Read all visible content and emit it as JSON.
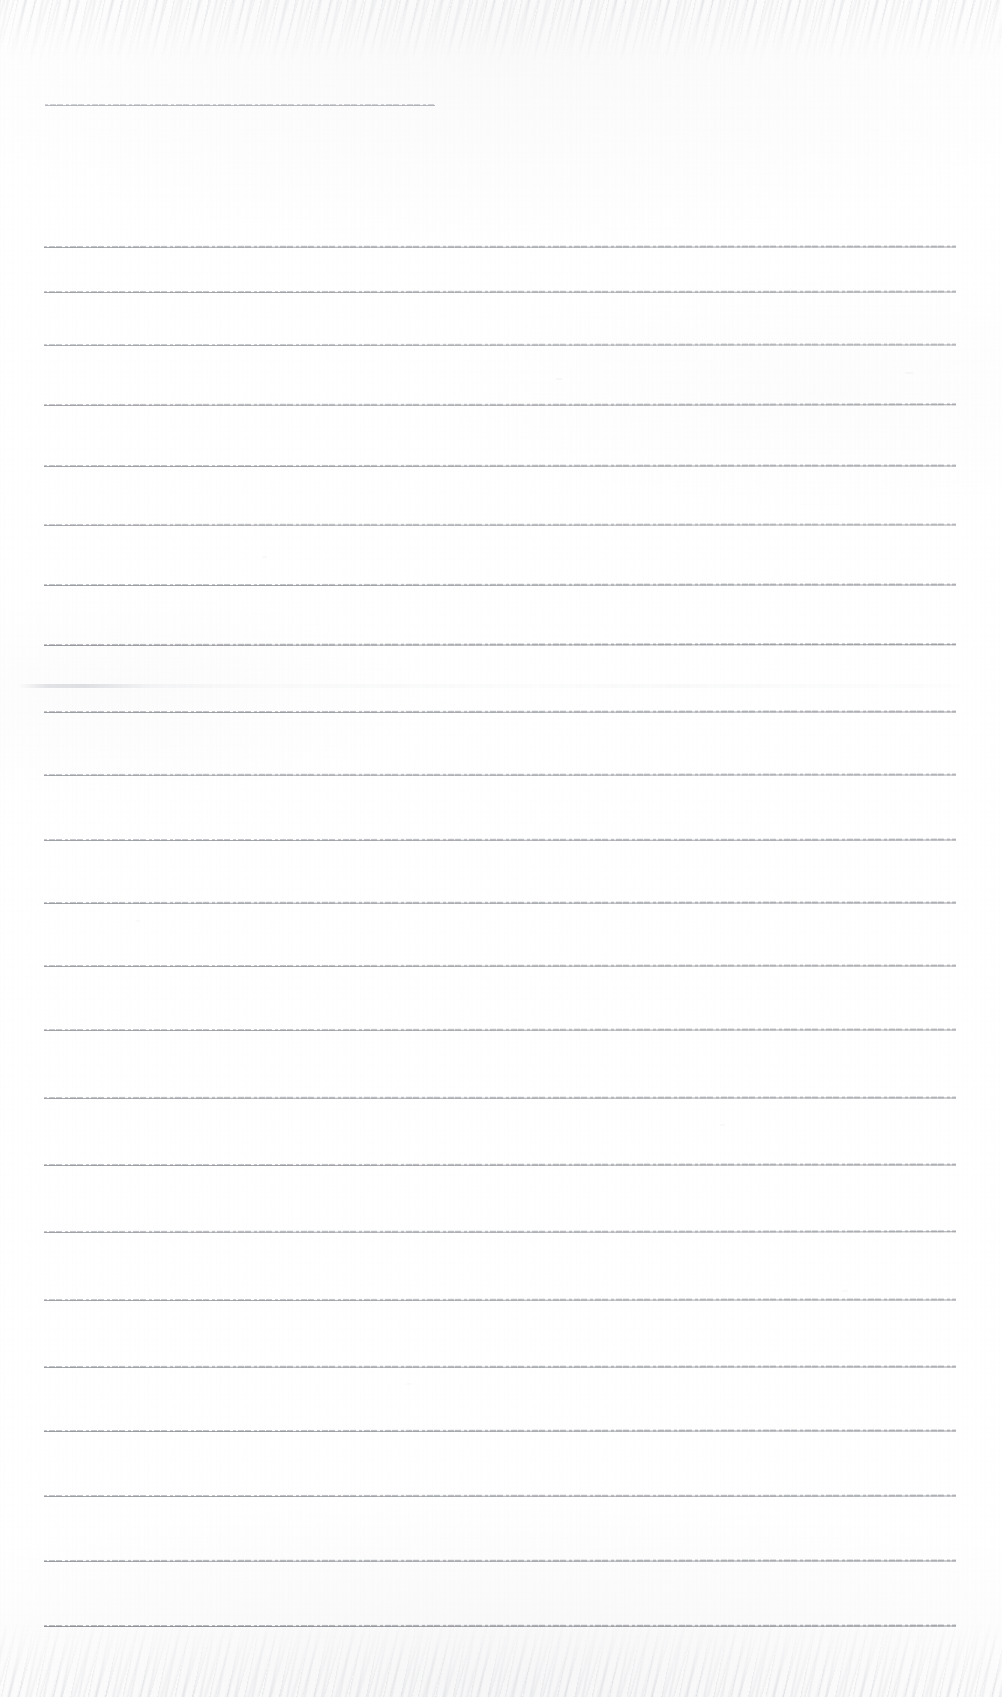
{
  "document": {
    "kind": "scanned-lined-paper",
    "title": "Blank ruled notebook page (scan)",
    "page_width": 1002,
    "page_height": 1697,
    "background_color": "#ffffff",
    "rule_color": "#6e7279",
    "text_content": "",
    "visible_text": []
  },
  "header_rule": {
    "label": "header-short-rule",
    "y": 105,
    "x_start": 45,
    "x_end": 435,
    "opacity": 0.62,
    "color": "#7c8088"
  },
  "body_rules": {
    "label": "body-ruled-lines",
    "count": 22,
    "x_start": 44,
    "x_end": 956,
    "spacing": 65.6,
    "first_y": 247,
    "lines": [
      {
        "y": 247,
        "x_start": 44,
        "x_end": 956,
        "opacity": 0.72,
        "slope": -0.6
      },
      {
        "y": 292,
        "x_start": 44,
        "x_end": 956,
        "opacity": 0.7,
        "slope": -0.4
      },
      {
        "y": 345,
        "x_start": 44,
        "x_end": 956,
        "opacity": 0.66,
        "slope": -0.5
      },
      {
        "y": 405,
        "x_start": 44,
        "x_end": 956,
        "opacity": 0.7,
        "slope": -0.7
      },
      {
        "y": 466,
        "x_start": 44,
        "x_end": 956,
        "opacity": 0.72,
        "slope": -0.5
      },
      {
        "y": 525,
        "x_start": 44,
        "x_end": 956,
        "opacity": 0.68,
        "slope": -0.6
      },
      {
        "y": 585,
        "x_start": 44,
        "x_end": 956,
        "opacity": 0.74,
        "slope": -0.5
      },
      {
        "y": 645,
        "x_start": 44,
        "x_end": 956,
        "opacity": 0.78,
        "slope": -0.8
      },
      {
        "y": 712,
        "x_start": 44,
        "x_end": 956,
        "opacity": 0.74,
        "slope": -0.5
      },
      {
        "y": 775,
        "x_start": 44,
        "x_end": 956,
        "opacity": 0.7,
        "slope": -0.6
      },
      {
        "y": 840,
        "x_start": 44,
        "x_end": 956,
        "opacity": 0.72,
        "slope": -0.4
      },
      {
        "y": 903,
        "x_start": 44,
        "x_end": 956,
        "opacity": 0.74,
        "slope": -0.6
      },
      {
        "y": 966,
        "x_start": 44,
        "x_end": 956,
        "opacity": 0.72,
        "slope": -0.5
      },
      {
        "y": 1030,
        "x_start": 44,
        "x_end": 956,
        "opacity": 0.7,
        "slope": -0.5
      },
      {
        "y": 1098,
        "x_start": 44,
        "x_end": 956,
        "opacity": 0.72,
        "slope": -0.6
      },
      {
        "y": 1165,
        "x_start": 44,
        "x_end": 956,
        "opacity": 0.74,
        "slope": -0.5
      },
      {
        "y": 1232,
        "x_start": 44,
        "x_end": 956,
        "opacity": 0.72,
        "slope": -0.7
      },
      {
        "y": 1300,
        "x_start": 44,
        "x_end": 956,
        "opacity": 0.7,
        "slope": -0.5
      },
      {
        "y": 1367,
        "x_start": 44,
        "x_end": 956,
        "opacity": 0.74,
        "slope": -0.6
      },
      {
        "y": 1431,
        "x_start": 44,
        "x_end": 956,
        "opacity": 0.76,
        "slope": -0.5
      },
      {
        "y": 1496,
        "x_start": 44,
        "x_end": 956,
        "opacity": 0.74,
        "slope": -0.4
      },
      {
        "y": 1561,
        "x_start": 44,
        "x_end": 956,
        "opacity": 0.76,
        "slope": -0.6
      },
      {
        "y": 1626,
        "x_start": 44,
        "x_end": 956,
        "opacity": 0.82,
        "slope": -0.4
      }
    ]
  },
  "ghost_rule": {
    "label": "ghost-smudge-rule",
    "y": 686,
    "x_start": 18,
    "x_end": 960,
    "opacity": 0.38
  },
  "artifacts": {
    "label": "scan-edge-noise",
    "top_band_height": 62,
    "bottom_band_height": 78,
    "flecks": [
      {
        "x": 556,
        "y": 378,
        "w": 6,
        "h": 2,
        "opacity": 0.22
      },
      {
        "x": 905,
        "y": 372,
        "w": 8,
        "h": 2,
        "opacity": 0.2
      },
      {
        "x": 262,
        "y": 556,
        "w": 5,
        "h": 2,
        "opacity": 0.18
      },
      {
        "x": 407,
        "y": 1383,
        "w": 4,
        "h": 2,
        "opacity": 0.18
      },
      {
        "x": 720,
        "y": 1124,
        "w": 5,
        "h": 2,
        "opacity": 0.16
      },
      {
        "x": 136,
        "y": 920,
        "w": 4,
        "h": 2,
        "opacity": 0.15
      },
      {
        "x": 842,
        "y": 1290,
        "w": 6,
        "h": 2,
        "opacity": 0.17
      }
    ]
  }
}
